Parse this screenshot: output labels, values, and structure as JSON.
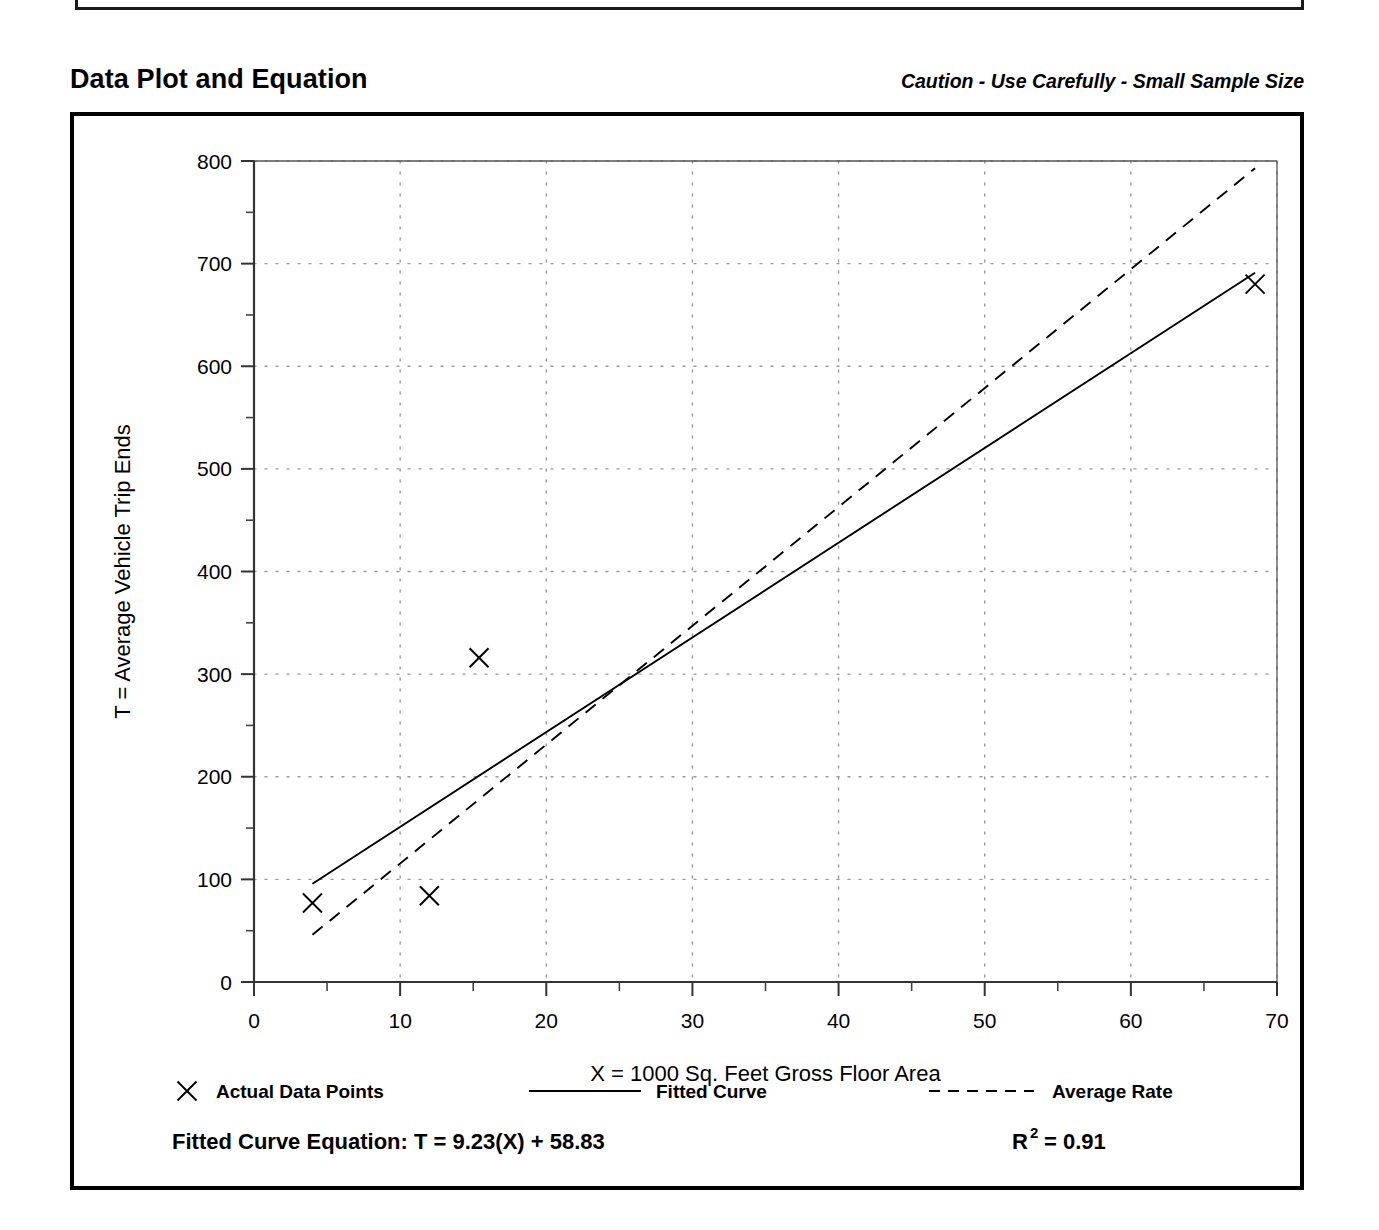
{
  "header": {
    "section_title": "Data Plot and Equation",
    "caution_note": "Caution - Use Carefully - Small Sample Size"
  },
  "footer": {
    "equation_label": "Fitted Curve Equation:",
    "equation": "T = 9.23(X) + 58.83",
    "r_squared_base": "R",
    "r_squared_exp": "2",
    "r_squared_value": "= 0.91"
  },
  "chart_data": {
    "type": "scatter",
    "title": "Data Plot and Equation",
    "xlabel": "X = 1000 Sq. Feet Gross Floor Area",
    "ylabel": "T = Average Vehicle Trip Ends",
    "xlim": [
      0,
      70
    ],
    "ylim": [
      0,
      800
    ],
    "xticks": [
      0,
      10,
      20,
      30,
      40,
      50,
      60,
      70
    ],
    "xtick_labels": [
      "0",
      "10",
      "20",
      "30",
      "40",
      "50",
      "60",
      "70"
    ],
    "yticks": [
      0,
      100,
      200,
      300,
      400,
      500,
      600,
      700,
      800
    ],
    "ytick_labels": [
      "0",
      "100",
      "200",
      "300",
      "400",
      "500",
      "600",
      "700",
      "800"
    ],
    "x_minor_step": 5,
    "y_minor_step": 50,
    "grid": true,
    "grid_style": "dotted",
    "grid_color": "#9a9a9a",
    "legend_position": "below-axes",
    "series": [
      {
        "name": "Actual Data Points",
        "type": "scatter",
        "marker": "x",
        "color": "#000000",
        "points": [
          {
            "x": 4.0,
            "y": 77
          },
          {
            "x": 12.0,
            "y": 84
          },
          {
            "x": 15.4,
            "y": 316
          },
          {
            "x": 68.5,
            "y": 680
          }
        ]
      },
      {
        "name": "Fitted Curve",
        "type": "line",
        "style": "solid",
        "color": "#000000",
        "equation": "T = 9.23(X) + 58.83",
        "slope": 9.23,
        "intercept": 58.83,
        "r_squared": 0.91,
        "x_range": [
          4.0,
          68.5
        ],
        "endpoints": [
          {
            "x": 4.0,
            "y": 95.8
          },
          {
            "x": 68.5,
            "y": 691.1
          }
        ]
      },
      {
        "name": "Average Rate",
        "type": "line",
        "style": "dashed",
        "color": "#000000",
        "rate": 11.6,
        "x_range": [
          4.0,
          68.5
        ],
        "endpoints": [
          {
            "x": 4.0,
            "y": 46
          },
          {
            "x": 68.5,
            "y": 793
          }
        ]
      }
    ]
  },
  "legend": {
    "items": [
      {
        "label": "Actual Data Points",
        "marker": "x-marker"
      },
      {
        "label": "Fitted Curve",
        "marker": "solid-line"
      },
      {
        "label": "Average Rate",
        "marker": "dashed-line"
      }
    ]
  }
}
